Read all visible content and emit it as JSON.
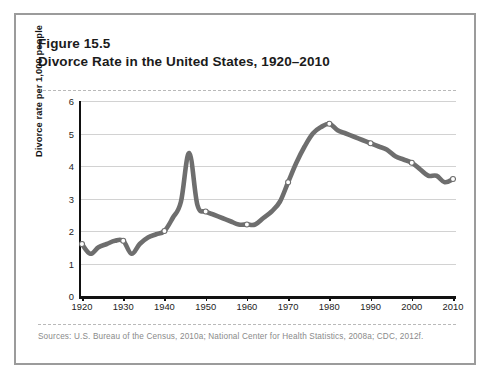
{
  "figure": {
    "number": "Figure 15.5",
    "title": "Divorce Rate in the United States, 1920–2010",
    "sources": "Sources: U.S. Bureau of the Census, 2010a; National Center for Health Statistics, 2008a; CDC, 2012f."
  },
  "chart_data": {
    "type": "line",
    "title": "Divorce Rate in the United States, 1920–2010",
    "xlabel": "",
    "ylabel": "Divorce rate per 1,000 people",
    "xlim": [
      1920,
      2010
    ],
    "ylim": [
      0,
      6
    ],
    "grid": true,
    "legend": null,
    "line_color": "#6e6e6e",
    "marker_fill": "#ffffff",
    "marker_edge": "#6e6e6e",
    "xticks": [
      1920,
      1930,
      1940,
      1950,
      1960,
      1970,
      1980,
      1990,
      2000,
      2010
    ],
    "yticks": [
      0,
      1,
      2,
      3,
      4,
      5,
      6
    ],
    "marker_years": [
      1920,
      1930,
      1940,
      1950,
      1960,
      1970,
      1980,
      1990,
      2000,
      2010
    ],
    "x": [
      1920,
      1922,
      1924,
      1926,
      1928,
      1930,
      1932,
      1934,
      1936,
      1938,
      1940,
      1942,
      1944,
      1946,
      1948,
      1950,
      1952,
      1954,
      1956,
      1958,
      1960,
      1962,
      1964,
      1966,
      1968,
      1970,
      1972,
      1974,
      1976,
      1978,
      1980,
      1982,
      1984,
      1986,
      1988,
      1990,
      1992,
      1994,
      1996,
      1998,
      2000,
      2002,
      2004,
      2006,
      2008,
      2010
    ],
    "values": [
      1.6,
      1.3,
      1.5,
      1.6,
      1.7,
      1.7,
      1.3,
      1.6,
      1.8,
      1.9,
      2.0,
      2.4,
      2.9,
      4.4,
      2.8,
      2.6,
      2.5,
      2.4,
      2.3,
      2.2,
      2.2,
      2.2,
      2.4,
      2.6,
      2.9,
      3.5,
      4.1,
      4.6,
      5.0,
      5.2,
      5.3,
      5.1,
      5.0,
      4.9,
      4.8,
      4.7,
      4.6,
      4.5,
      4.3,
      4.2,
      4.1,
      3.9,
      3.7,
      3.7,
      3.5,
      3.6
    ],
    "annotations": {
      "postwar_spike": {
        "year": 1946,
        "value": 4.4
      },
      "peak": {
        "year": 1980,
        "value": 5.3
      },
      "depression_low": {
        "year": 1932,
        "value": 1.3
      }
    }
  }
}
